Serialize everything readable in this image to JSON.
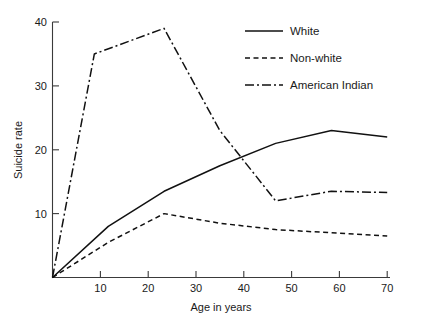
{
  "chart_data": {
    "type": "line",
    "title": "",
    "xlabel": "Age in years",
    "ylabel": "Suicide rate",
    "xlim": [
      5,
      72
    ],
    "ylim": [
      0,
      41
    ],
    "xticks": [
      10,
      20,
      30,
      40,
      50,
      60,
      70
    ],
    "yticks": [
      10,
      20,
      30,
      40
    ],
    "xtick_labels": [
      "10",
      "20",
      "30",
      "40",
      "50",
      "60",
      "70"
    ],
    "ytick_labels": [
      "10",
      "20",
      "30",
      "40"
    ],
    "grid": false,
    "legend_position": "top-right",
    "series": [
      {
        "name": "White",
        "style": "solid",
        "x": [
          10,
          20,
          30,
          40,
          50,
          60,
          70
        ],
        "values": [
          0,
          8,
          13.5,
          17.5,
          21,
          23,
          22
        ]
      },
      {
        "name": "Non-white",
        "style": "dashed",
        "x": [
          10,
          20,
          30,
          40,
          50,
          60,
          70
        ],
        "values": [
          0,
          5.5,
          10,
          8.5,
          7.5,
          7,
          6.5
        ]
      },
      {
        "name": "American Indian",
        "style": "dashdot",
        "x": [
          10,
          17.5,
          30,
          40,
          50,
          60,
          70
        ],
        "values": [
          0,
          35,
          39,
          23,
          12,
          13.5,
          13.3
        ]
      }
    ]
  },
  "legend": {
    "entries": [
      {
        "label": "White",
        "style": "solid"
      },
      {
        "label": "Non-white",
        "style": "dashed"
      },
      {
        "label": "American Indian",
        "style": "dashdot"
      }
    ]
  }
}
